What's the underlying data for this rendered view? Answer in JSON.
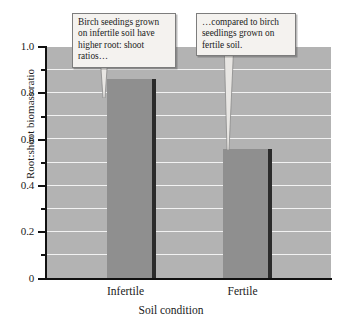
{
  "chart_data": {
    "type": "bar",
    "title": "",
    "subtitle": "",
    "xlabel": "Soil condition",
    "ylabel": "Root:shoot biomass ratio",
    "categories": [
      "Infertile",
      "Fertile"
    ],
    "values": [
      0.86,
      0.56
    ],
    "ylim": [
      0,
      1.0
    ],
    "ytick_labels": [
      "0",
      "0.2",
      "0.4",
      "0.6",
      "0.8",
      "1.0"
    ],
    "ytick_values": [
      0,
      0.2,
      0.4,
      0.6,
      0.8,
      1.0
    ],
    "minor_tick_values": [
      0.1,
      0.3,
      0.5,
      0.7,
      0.9
    ],
    "gridline_values": [
      0.1,
      0.2,
      0.3,
      0.4,
      0.5,
      0.6,
      0.7,
      0.8,
      0.9
    ],
    "grid": true,
    "legend": "none",
    "series": [
      {
        "name": "Root:shoot biomass ratio",
        "values": [
          0.86,
          0.56
        ]
      }
    ],
    "annotations": [
      {
        "id": "annotation-infertile",
        "text": "Birch seedings grown on infertile soil have higher root: shoot ratios…",
        "points_to": "Infertile"
      },
      {
        "id": "annotation-fertile",
        "text": "…compared to birch seedlings grown on fertile soil.",
        "points_to": "Fertile"
      }
    ],
    "colors": {
      "plot_background": "#b3b3b3",
      "gridline": "#f2f2f2",
      "bar_fill": "#8f8f8f",
      "bar_shadow": "#2b2b2b",
      "axis": "#111111",
      "callout_background": "#f4f2ef",
      "callout_border": "#7d7d7d",
      "text": "#1a1a1a"
    }
  }
}
